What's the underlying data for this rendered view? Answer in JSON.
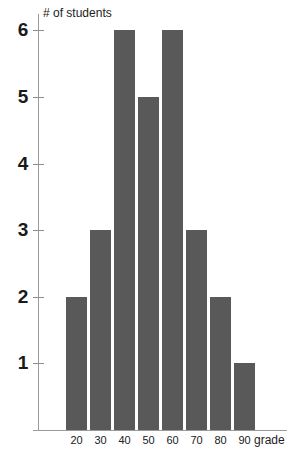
{
  "chart_data": {
    "type": "bar",
    "title": "",
    "subtitle": "",
    "xlabel": "grade",
    "ylabel": "# of students",
    "categories": [
      "20",
      "30",
      "40",
      "50",
      "60",
      "70",
      "80",
      "90"
    ],
    "values": [
      2,
      3,
      6,
      5,
      6,
      3,
      2,
      1
    ],
    "series": [
      {
        "name": "# of students",
        "values": [
          2,
          3,
          6,
          5,
          6,
          3,
          2,
          1
        ]
      }
    ],
    "y_ticks": [
      1,
      2,
      3,
      4,
      5,
      6
    ],
    "y_tick_labels": [
      "1",
      "2",
      "3",
      "4",
      "5",
      "6"
    ],
    "ylim": [
      0,
      6.3
    ],
    "xlim_categories": 8,
    "grid": false,
    "legend": false,
    "legend_position": "none",
    "bar_color": "#595959",
    "axis_color": "#9a9a9a",
    "text_color": "#1a1a1a",
    "background_color": "#ffffff",
    "annotations": []
  },
  "axis_titles": {
    "y": "# of students",
    "x": "grade"
  }
}
